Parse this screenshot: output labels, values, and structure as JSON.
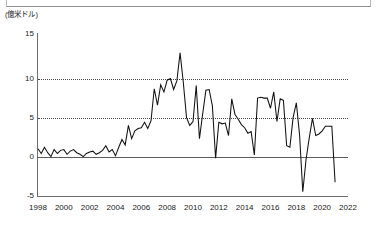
{
  "chart_data": {
    "type": "line",
    "title": "",
    "subtitle": "",
    "xlabel": "",
    "ylabel": "(億米ドル)",
    "unit_caption": "(億米ドル)",
    "xlim": [
      1998,
      2022
    ],
    "ylim": [
      -5,
      15
    ],
    "xticks": [
      "1998",
      "2000",
      "2002",
      "2004",
      "2006",
      "2008",
      "2010",
      "2012",
      "2014",
      "2016",
      "2018",
      "2020",
      "2022"
    ],
    "yticks": [
      "15",
      "10",
      "5",
      "0",
      "-5"
    ],
    "grid": "dotted horizontal gridlines at 10 and 5; solid zero line",
    "legend": "none",
    "line_color": "#121212",
    "series": [
      {
        "name": "series-1",
        "x": [
          1998.0,
          1998.25,
          1998.5,
          1998.75,
          1999.0,
          1999.25,
          1999.5,
          1999.75,
          2000.0,
          2000.25,
          2000.5,
          2000.75,
          2001.0,
          2001.25,
          2001.5,
          2001.75,
          2002.0,
          2002.25,
          2002.5,
          2002.75,
          2003.0,
          2003.25,
          2003.5,
          2003.75,
          2004.0,
          2004.25,
          2004.5,
          2004.75,
          2005.0,
          2005.25,
          2005.5,
          2005.75,
          2006.0,
          2006.25,
          2006.5,
          2006.75,
          2007.0,
          2007.25,
          2007.5,
          2007.75,
          2008.0,
          2008.25,
          2008.5,
          2008.75,
          2009.0,
          2009.25,
          2009.5,
          2009.75,
          2010.0,
          2010.25,
          2010.5,
          2010.75,
          2011.0,
          2011.25,
          2011.5,
          2011.75,
          2012.0,
          2012.25,
          2012.5,
          2012.75,
          2013.0,
          2013.25,
          2013.5,
          2013.75,
          2014.0,
          2014.25,
          2014.5,
          2014.75,
          2015.0,
          2015.25,
          2015.5,
          2015.75,
          2016.0,
          2016.25,
          2016.5,
          2016.75,
          2017.0,
          2017.25,
          2017.5,
          2017.75,
          2018.0,
          2018.25,
          2018.5,
          2018.75,
          2019.0,
          2019.25,
          2019.5,
          2019.75,
          2020.0,
          2020.25,
          2020.5,
          2020.75,
          2021.0
        ],
        "values": [
          1.0,
          0.4,
          1.2,
          0.5,
          0.0,
          0.9,
          0.4,
          0.8,
          0.9,
          0.3,
          0.7,
          0.9,
          0.5,
          0.3,
          0.0,
          0.4,
          0.6,
          0.7,
          0.3,
          0.5,
          0.8,
          1.4,
          0.6,
          0.9,
          0.1,
          1.2,
          2.2,
          1.5,
          4.0,
          2.3,
          3.3,
          3.6,
          3.7,
          4.4,
          3.6,
          4.6,
          8.7,
          6.6,
          9.2,
          8.3,
          9.8,
          10.0,
          8.6,
          9.7,
          13.3,
          9.5,
          5.0,
          4.0,
          4.5,
          9.1,
          2.3,
          5.5,
          8.5,
          8.6,
          6.5,
          -0.2,
          4.4,
          4.2,
          4.3,
          2.7,
          7.4,
          5.4,
          4.8,
          4.1,
          3.7,
          3.0,
          3.2,
          0.2,
          7.5,
          7.6,
          7.5,
          7.5,
          6.2,
          8.3,
          4.5,
          7.4,
          7.2,
          1.4,
          1.2,
          5.0,
          6.9,
          2.8,
          -4.5,
          -0.4,
          2.4,
          4.9,
          2.7,
          2.9,
          3.3,
          3.9,
          3.9,
          3.9,
          -3.3
        ]
      }
    ],
    "annotations": {
      "peak_value": 13.3,
      "peak_year": "2009",
      "min_value": -4.5,
      "min_year": "2018",
      "final_value": -3.3,
      "final_year": "2021"
    }
  },
  "axes": {
    "y_unit_label": "(億米ドル)",
    "y_tick_labels": [
      "15",
      "10",
      "5",
      "0",
      "-5"
    ],
    "x_tick_labels": [
      "1998",
      "2000",
      "2002",
      "2004",
      "2006",
      "2008",
      "2010",
      "2012",
      "2014",
      "2016",
      "2018",
      "2020",
      "2022"
    ]
  }
}
